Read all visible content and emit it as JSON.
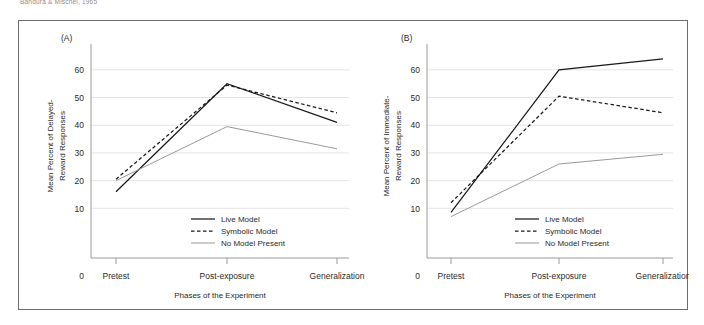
{
  "figure": {
    "caption": "Bandura & Mischel, 1965",
    "frame_color": "#6d6d70"
  },
  "panels": [
    {
      "tag": "(A)",
      "name": "panel-a"
    },
    {
      "tag": "(B)",
      "name": "panel-b"
    }
  ],
  "legend": {
    "position": "inside-bottom-right",
    "entries": [
      {
        "label": "Live Model",
        "style": "solid",
        "color": "#1a1a1a"
      },
      {
        "label": "Symbolic Model",
        "style": "dashed",
        "color": "#1a1a1a"
      },
      {
        "label": "No Model Present",
        "style": "solid",
        "color": "#9a9a9d"
      }
    ]
  },
  "chart_data": [
    {
      "type": "line",
      "panel": "(A)",
      "title": "",
      "xlabel": "Phases of the Experiment",
      "ylabel": "Mean Percent of Delayed-Reward Responses",
      "categories": [
        "Pretest",
        "Post-exposure",
        "Generalization"
      ],
      "origin_label": "0",
      "yticks": [
        10,
        20,
        30,
        40,
        50,
        60
      ],
      "ylim": [
        0,
        65
      ],
      "grid": true,
      "legend_position": "inside-bottom-right",
      "series": [
        {
          "name": "Live Model",
          "style": "solid",
          "color": "#1a1a1a",
          "values": [
            16,
            55,
            41
          ]
        },
        {
          "name": "Symbolic Model",
          "style": "dashed",
          "color": "#1a1a1a",
          "values": [
            20.5,
            54.5,
            44.5
          ]
        },
        {
          "name": "No Model Present",
          "style": "solid",
          "color": "#9a9a9d",
          "values": [
            20,
            39.5,
            31.5
          ]
        }
      ]
    },
    {
      "type": "line",
      "panel": "(B)",
      "title": "",
      "xlabel": "Phases of the Experiment",
      "ylabel": "Mean Percent of Immediate-Reward Responses",
      "categories": [
        "Pretest",
        "Post-exposure",
        "Generalization"
      ],
      "origin_label": "0",
      "yticks": [
        10,
        20,
        30,
        40,
        50,
        60
      ],
      "ylim": [
        0,
        65
      ],
      "grid": true,
      "legend_position": "inside-bottom-right",
      "series": [
        {
          "name": "Live Model",
          "style": "solid",
          "color": "#1a1a1a",
          "values": [
            8.5,
            60,
            64
          ]
        },
        {
          "name": "Symbolic Model",
          "style": "dashed",
          "color": "#1a1a1a",
          "values": [
            12,
            50.5,
            44.5
          ]
        },
        {
          "name": "No Model Present",
          "style": "solid",
          "color": "#9a9a9d",
          "values": [
            7,
            26,
            29.5
          ]
        }
      ]
    }
  ]
}
